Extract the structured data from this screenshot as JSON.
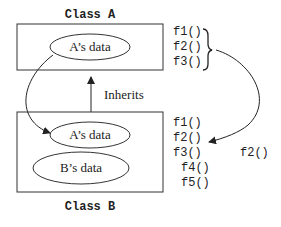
{
  "class_a": {
    "title": "Class A",
    "data_label": "A’s data",
    "methods": [
      "f1()",
      "f2()",
      "f3()"
    ]
  },
  "class_b": {
    "title": "Class B",
    "data_labels": [
      "A’s data",
      "B’s data"
    ],
    "methods": [
      "f1()",
      "f2()",
      "f3()",
      "f4()",
      "f5()"
    ],
    "override_label": "f2()"
  },
  "relation": {
    "label": "Inherits"
  }
}
